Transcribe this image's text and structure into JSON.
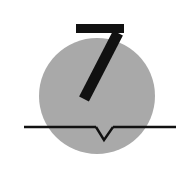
{
  "figure": {
    "name": "numbered-circle-with-notched-baseline",
    "description": "Gray filled circle overlaid with the numeral 7 and crossed by a horizontal baseline bearing a V notch",
    "background_color": "#ffffff",
    "width": 180,
    "height": 183
  },
  "circle": {
    "label": "gray-disc",
    "fill_color": "#a9a9a9",
    "center_x": 97,
    "center_y": 96,
    "radius": 58
  },
  "numeral": {
    "value": "7",
    "color": "#111111",
    "top_bar": {
      "x": 76,
      "y": 24,
      "width": 48,
      "height": 9
    },
    "diagonal": {
      "top_x": 118,
      "top_y": 33,
      "bottom_x": 84,
      "bottom_y": 99,
      "stroke_width": 11
    }
  },
  "baseline": {
    "label": "horizontal-rule",
    "color": "#111111",
    "x_start": 24,
    "x_end": 176,
    "y": 127,
    "thickness": 2.4
  },
  "notch": {
    "label": "v-notch",
    "color": "#111111",
    "left_x": 96,
    "right_x": 113,
    "apex_x": 104,
    "apex_y": 140,
    "stroke_width": 2.4
  }
}
